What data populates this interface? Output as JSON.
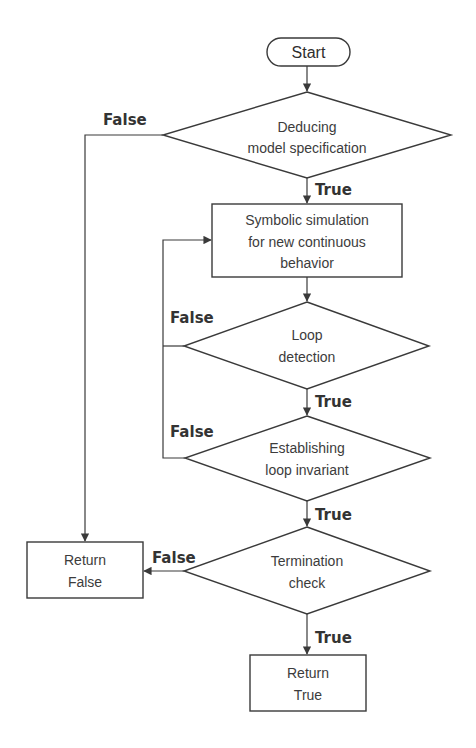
{
  "diagram": {
    "type": "flowchart",
    "colors": {
      "stroke": "#3a3a3a",
      "text": "#3c3c3c",
      "background": "#ffffff"
    },
    "nodes": {
      "start": {
        "kind": "terminator",
        "lines": [
          "Start"
        ]
      },
      "deduce": {
        "kind": "decision",
        "lines": [
          "Deducing",
          "model specification"
        ]
      },
      "simulate": {
        "kind": "process",
        "lines": [
          "Symbolic simulation",
          "for new continuous",
          "behavior"
        ]
      },
      "loop_detect": {
        "kind": "decision",
        "lines": [
          "Loop",
          "detection"
        ]
      },
      "invariant": {
        "kind": "decision",
        "lines": [
          "Establishing",
          "loop invariant"
        ]
      },
      "termination": {
        "kind": "decision",
        "lines": [
          "Termination",
          "check"
        ]
      },
      "return_false": {
        "kind": "process",
        "lines": [
          "Return",
          "False"
        ]
      },
      "return_true": {
        "kind": "process",
        "lines": [
          "Return",
          "True"
        ]
      }
    },
    "edges": [
      {
        "from": "start",
        "to": "deduce",
        "label": ""
      },
      {
        "from": "deduce",
        "to": "simulate",
        "label": "True"
      },
      {
        "from": "deduce",
        "to": "return_false",
        "label": "False"
      },
      {
        "from": "simulate",
        "to": "loop_detect",
        "label": ""
      },
      {
        "from": "loop_detect",
        "to": "invariant",
        "label": "True"
      },
      {
        "from": "loop_detect",
        "to": "simulate",
        "label": "False"
      },
      {
        "from": "invariant",
        "to": "termination",
        "label": "True"
      },
      {
        "from": "invariant",
        "to": "simulate",
        "label": "False"
      },
      {
        "from": "termination",
        "to": "return_true",
        "label": "True"
      },
      {
        "from": "termination",
        "to": "return_false",
        "label": "False"
      }
    ],
    "labels": {
      "true": "True",
      "false": "False"
    }
  }
}
